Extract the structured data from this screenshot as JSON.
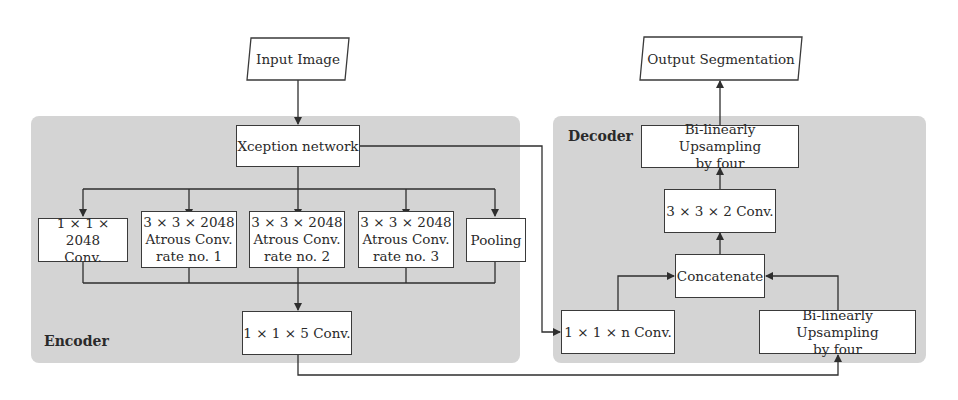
{
  "diagram": {
    "type": "flowchart",
    "io": {
      "input": "Input Image",
      "output": "Output Segmentation"
    },
    "encoder": {
      "label": "Encoder",
      "backbone": "Xception network",
      "branches": [
        {
          "label": "1 × 1 × 2048\nConv."
        },
        {
          "label": "3 × 3 × 2048\nAtrous Conv.\nrate no. 1"
        },
        {
          "label": "3 × 3 × 2048\nAtrous Conv.\nrate no. 2"
        },
        {
          "label": "3 × 3 × 2048\nAtrous Conv.\nrate no. 3"
        },
        {
          "label": "Pooling"
        }
      ],
      "fusion": "1 × 1 × 5 Conv."
    },
    "decoder": {
      "label": "Decoder",
      "upsample_top": "Bi-linearly Upsampling\nby four",
      "conv_3x3": "3 × 3 × 2 Conv.",
      "concat": "Concatenate",
      "conv_1x1_n": "1 × 1 × n Conv.",
      "upsample_bottom": "Bi-linearly Upsampling\nby four"
    },
    "edges": [
      [
        "Input Image",
        "Xception network"
      ],
      [
        "Xception network",
        "1 × 1 × 2048 Conv."
      ],
      [
        "Xception network",
        "3 × 3 × 2048 Atrous Conv. rate no. 1"
      ],
      [
        "Xception network",
        "3 × 3 × 2048 Atrous Conv. rate no. 2"
      ],
      [
        "Xception network",
        "3 × 3 × 2048 Atrous Conv. rate no. 3"
      ],
      [
        "Xception network",
        "Pooling"
      ],
      [
        "branches (merged)",
        "1 × 1 × 5 Conv."
      ],
      [
        "Xception network",
        "1 × 1 × n Conv."
      ],
      [
        "1 × 1 × 5 Conv.",
        "Bi-linearly Upsampling by four (bottom)"
      ],
      [
        "1 × 1 × n Conv.",
        "Concatenate"
      ],
      [
        "Bi-linearly Upsampling by four (bottom)",
        "Concatenate"
      ],
      [
        "Concatenate",
        "3 × 3 × 2 Conv."
      ],
      [
        "3 × 3 × 2 Conv.",
        "Bi-linearly Upsampling by four (top)"
      ],
      [
        "Bi-linearly Upsampling by four (top)",
        "Output Segmentation"
      ]
    ]
  },
  "colors": {
    "panel": "#d4d4d4",
    "line": "#2e2e2e",
    "box_fill": "#ffffff"
  }
}
